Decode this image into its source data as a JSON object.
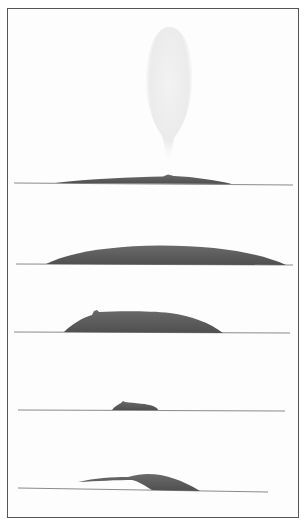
{
  "figure": {
    "panels": [
      {
        "id": 1,
        "stage": "blow",
        "waterline_y": 183,
        "body": {
          "x_start": 55,
          "x_end": 230,
          "peak_y": 176
        },
        "spout": {
          "cx": 169,
          "top_y": 27,
          "bottom_y": 165,
          "width": 46
        }
      },
      {
        "id": 2,
        "stage": "back-arch",
        "waterline_y": 264,
        "body": {
          "x_start": 46,
          "x_end": 285,
          "peak_y": 245
        }
      },
      {
        "id": 3,
        "stage": "dorsal-fin-showing",
        "waterline_y": 332,
        "body": {
          "x_start": 64,
          "x_end": 222,
          "peak_y": 312
        },
        "fin_x": 96
      },
      {
        "id": 4,
        "stage": "dorsal-fin-low",
        "waterline_y": 410,
        "body": {
          "x_start": 112,
          "x_end": 158,
          "peak_y": 402
        },
        "fin_x": 122
      },
      {
        "id": 5,
        "stage": "tail-stock-arch",
        "waterline_y": 490,
        "body": {
          "x_start": 78,
          "x_end": 200,
          "peak_y": 474
        }
      }
    ],
    "colors": {
      "background": "#ffffff",
      "frame": "#555555",
      "whale": "#5e5e5e",
      "water_line": "#8a8a8a",
      "spout": "#e8e8e8"
    }
  }
}
